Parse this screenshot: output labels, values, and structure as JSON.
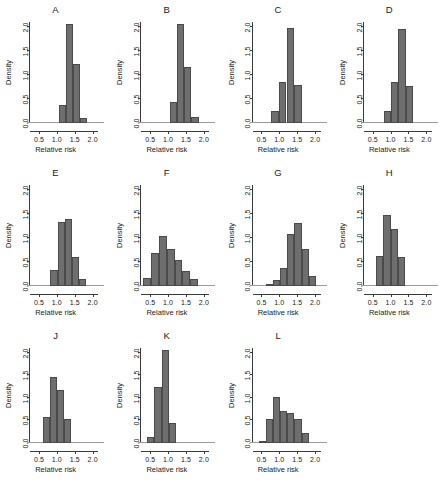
{
  "figure": {
    "axis": {
      "xlabel": "Relative risk",
      "ylabel": "Density",
      "xticks": [
        "0.5",
        "1.0",
        "1.5",
        "2.0"
      ],
      "xtick_values": [
        0.5,
        1.0,
        1.5,
        2.0
      ],
      "yticks": [
        "0.0",
        "0.5",
        "1.0",
        "1.5",
        "2.0"
      ],
      "ytick_values": [
        0.0,
        0.5,
        1.0,
        1.5,
        2.0
      ],
      "xlim": [
        0.25,
        2.15
      ],
      "ylim": [
        0.0,
        2.1
      ]
    },
    "colors": {
      "bar_fill": "#6e6e6e",
      "bar_stroke": "#4a4a4a",
      "axis": "#3a3a3a",
      "text": "#1a1a1a",
      "background": "#ffffff"
    }
  },
  "chart_data": [
    {
      "type": "bar",
      "title": "A",
      "xlabel": "Relative risk",
      "ylabel": "Density",
      "xlim": [
        0.25,
        2.15
      ],
      "ylim": [
        0,
        2.1
      ],
      "bin_edges": [
        1.05,
        1.25,
        1.45,
        1.65,
        1.85
      ],
      "values": [
        0.38,
        2.05,
        1.22,
        0.11
      ],
      "grid": false
    },
    {
      "type": "bar",
      "title": "B",
      "xlabel": "Relative risk",
      "ylabel": "Density",
      "xlim": [
        0.25,
        2.15
      ],
      "ylim": [
        0,
        2.1
      ],
      "bin_edges": [
        1.05,
        1.25,
        1.45,
        1.65,
        1.85
      ],
      "values": [
        0.43,
        2.05,
        1.17,
        0.13
      ],
      "grid": false
    },
    {
      "type": "bar",
      "title": "C",
      "xlabel": "Relative risk",
      "ylabel": "Density",
      "xlim": [
        0.25,
        2.15
      ],
      "ylim": [
        0,
        2.1
      ],
      "bin_edges": [
        0.78,
        1.0,
        1.2,
        1.4,
        1.62
      ],
      "values": [
        0.24,
        0.86,
        1.97,
        0.79
      ],
      "grid": false
    },
    {
      "type": "bar",
      "title": "D",
      "xlabel": "Relative risk",
      "ylabel": "Density",
      "xlim": [
        0.25,
        2.15
      ],
      "ylim": [
        0,
        2.1
      ],
      "bin_edges": [
        0.82,
        1.02,
        1.22,
        1.42,
        1.62
      ],
      "values": [
        0.25,
        0.85,
        1.96,
        0.78
      ],
      "grid": false
    },
    {
      "type": "bar",
      "title": "E",
      "xlabel": "Relative risk",
      "ylabel": "Density",
      "xlim": [
        0.25,
        2.15
      ],
      "ylim": [
        0,
        2.1
      ],
      "bin_edges": [
        0.82,
        1.02,
        1.22,
        1.42,
        1.62,
        1.82
      ],
      "values": [
        0.33,
        1.34,
        1.39,
        0.61,
        0.15
      ],
      "grid": false
    },
    {
      "type": "bar",
      "title": "F",
      "xlabel": "Relative risk",
      "ylabel": "Density",
      "xlim": [
        0.25,
        2.15
      ],
      "ylim": [
        0,
        2.1
      ],
      "bin_edges": [
        0.3,
        0.52,
        0.74,
        0.96,
        1.18,
        1.4,
        1.62,
        1.84
      ],
      "values": [
        0.17,
        0.68,
        1.03,
        0.78,
        0.54,
        0.31,
        0.14
      ],
      "grid": false
    },
    {
      "type": "bar",
      "title": "G",
      "xlabel": "Relative risk",
      "ylabel": "Density",
      "xlim": [
        0.25,
        2.15
      ],
      "ylim": [
        0,
        2.1
      ],
      "bin_edges": [
        0.62,
        0.82,
        1.02,
        1.22,
        1.42,
        1.62,
        1.82,
        2.02
      ],
      "values": [
        0.03,
        0.13,
        0.38,
        1.09,
        1.31,
        0.78,
        0.21
      ],
      "grid": false
    },
    {
      "type": "bar",
      "title": "H",
      "xlabel": "Relative risk",
      "ylabel": "Density",
      "xlim": [
        0.25,
        2.15
      ],
      "ylim": [
        0,
        2.1
      ],
      "bin_edges": [
        0.6,
        0.8,
        1.0,
        1.2,
        1.4
      ],
      "values": [
        0.62,
        1.47,
        1.19,
        0.61
      ],
      "grid": false
    },
    {
      "type": "bar",
      "title": "J",
      "xlabel": "Relative risk",
      "ylabel": "Density",
      "xlim": [
        0.25,
        2.15
      ],
      "ylim": [
        0,
        2.1
      ],
      "bin_edges": [
        0.6,
        0.8,
        1.0,
        1.2,
        1.4
      ],
      "values": [
        0.57,
        1.47,
        1.18,
        0.53
      ],
      "grid": false
    },
    {
      "type": "bar",
      "title": "K",
      "xlabel": "Relative risk",
      "ylabel": "Density",
      "xlim": [
        0.25,
        2.15
      ],
      "ylim": [
        0,
        2.1
      ],
      "bin_edges": [
        0.42,
        0.62,
        0.82,
        1.02,
        1.22
      ],
      "values": [
        0.13,
        1.23,
        2.05,
        0.45
      ],
      "grid": false
    },
    {
      "type": "bar",
      "title": "L",
      "xlabel": "Relative risk",
      "ylabel": "Density",
      "xlim": [
        0.25,
        2.15
      ],
      "ylim": [
        0,
        2.1
      ],
      "bin_edges": [
        0.42,
        0.62,
        0.82,
        1.02,
        1.22,
        1.42,
        1.62,
        1.82
      ],
      "values": [
        0.05,
        0.52,
        1.02,
        0.71,
        0.66,
        0.54,
        0.23
      ],
      "grid": false
    }
  ]
}
